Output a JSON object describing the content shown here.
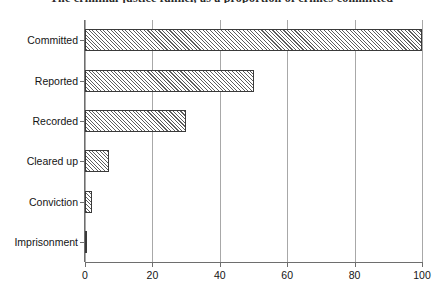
{
  "chart_data": {
    "type": "bar",
    "orientation": "horizontal",
    "title": "The criminal justice funnel, as a proportion of crimes committed",
    "xlabel": "",
    "ylabel": "",
    "categories": [
      "Committed",
      "Reported",
      "Recorded",
      "Cleared up",
      "Conviction",
      "Imprisonment"
    ],
    "values": [
      100,
      50,
      30,
      7,
      2,
      0.3
    ],
    "xlim": [
      0,
      100
    ],
    "xticks": [
      0,
      20,
      40,
      60,
      80,
      100
    ],
    "xtick_labels": [
      "0",
      "20",
      "40",
      "60",
      "80",
      "100"
    ],
    "grid": true,
    "grid_axis": "x",
    "legend": false,
    "bar_fill": "diagonal-hatch",
    "colors": {
      "bar_hatch": "#5d5d5d",
      "bar_edge": "#3a3a3a",
      "bar_background": "#ffffff",
      "gridline": "#a8a8a8",
      "axis": "#6e6e6e",
      "text": "#141414",
      "page_background": "#ffffff"
    }
  }
}
